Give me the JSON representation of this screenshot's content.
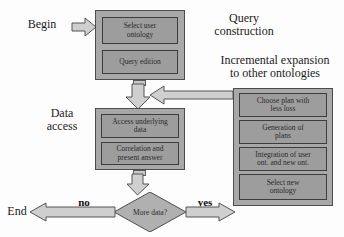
{
  "diagram": {
    "colors": {
      "panel_fill": "#a8a8a8",
      "box_fill": "#9d9d9d",
      "arrow_fill": "#cfcfcf",
      "outline": "#4d4d4d",
      "text": "#1b1b1b"
    },
    "terminals": {
      "begin": "Begin",
      "end": "End"
    },
    "stage_labels": {
      "query_construction": "Query\nconstruction",
      "incremental_expansion": "Incremental expansion\nto other ontologies",
      "data_access": "Data\naccess"
    },
    "branch_labels": {
      "no": "no",
      "yes": "yes"
    },
    "decision": {
      "text": "More data?"
    },
    "panels": [
      {
        "id": "query-construction-panel",
        "steps": [
          {
            "id": "select-user-ontology",
            "text": "Select user\nontology"
          },
          {
            "id": "query-edition",
            "text": "Query edition"
          }
        ]
      },
      {
        "id": "data-access-panel",
        "steps": [
          {
            "id": "access-underlying-data",
            "text": "Access underlying\ndata"
          },
          {
            "id": "correlation-present-answer",
            "text": "Correlation and\npresent answer"
          }
        ]
      },
      {
        "id": "incremental-expansion-panel",
        "steps": [
          {
            "id": "choose-plan-less-loss",
            "text": "Choose plan with\nless loss"
          },
          {
            "id": "generation-of-plans",
            "text": "Generation of\nplans"
          },
          {
            "id": "integration-of-ontologies",
            "text": "Integration of user\nont. and new ont."
          },
          {
            "id": "select-new-ontology",
            "text": "Select new\nontology"
          }
        ]
      }
    ]
  }
}
